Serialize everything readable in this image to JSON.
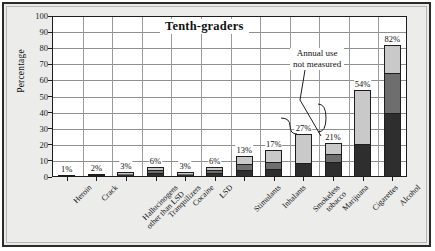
{
  "figure": {
    "title": "Tenth-graders",
    "ylabel": "Percentage",
    "annotation_line1": "Annual use",
    "annotation_line2": "not measured"
  },
  "chart_data": {
    "type": "bar",
    "subtype": "stacked-bar",
    "title": "Tenth-graders",
    "xlabel": "",
    "ylabel": "Percentage",
    "ylim": [
      0,
      100
    ],
    "yticks": [
      0,
      10,
      20,
      30,
      40,
      50,
      60,
      70,
      80,
      90,
      100
    ],
    "ytick_labels": [
      "0",
      "10",
      "20",
      "30",
      "40",
      "50",
      "60",
      "70",
      "80",
      "90",
      "100"
    ],
    "grid": true,
    "legend": null,
    "annotations": [
      {
        "text": "Annual use not measured",
        "points_to": [
          "Smokeless tobacco",
          "Cigarettes"
        ]
      }
    ],
    "categories": [
      "Heroin",
      "Crack",
      "Hallucinogens other than LSD",
      "Tranquilizers",
      "Cocaine",
      "LSD",
      "Stimulants",
      "Inhalants",
      "Smokeless tobacco",
      "Marijuana",
      "Cigarettes",
      "Alcohol"
    ],
    "data_labels": [
      "1%",
      "2%",
      "3%",
      "6%",
      "3%",
      "6%",
      "13%",
      "17%",
      "27%",
      "21%",
      "54%",
      "82%"
    ],
    "values": [
      1,
      2,
      3,
      6,
      3,
      6,
      13,
      17,
      27,
      21,
      54,
      82
    ],
    "series": [
      {
        "name": "Lifetime use",
        "color": "#c9c9c9",
        "values": [
          1,
          2,
          3,
          6,
          3,
          6,
          13,
          17,
          27,
          21,
          54,
          82
        ]
      },
      {
        "name": "Annual use",
        "color": "#6e6e6e",
        "values": [
          0.6,
          1.3,
          2,
          4,
          2,
          4,
          8,
          9,
          0,
          14,
          0,
          65
        ]
      },
      {
        "name": "Past-month use",
        "color": "#2e2e2e",
        "values": [
          0.3,
          0.7,
          1,
          2,
          1,
          2,
          4,
          4,
          8,
          9,
          20,
          40
        ]
      }
    ]
  },
  "bars": [
    {
      "label": "Heroin",
      "label_text": "1%",
      "total": 1,
      "dark": 0.3,
      "mid": 0.3,
      "light": 0.4
    },
    {
      "label": "Crack",
      "label_text": "2%",
      "total": 2,
      "dark": 0.7,
      "mid": 0.6,
      "light": 0.7
    },
    {
      "label": "Hallucinogens other than LSD",
      "label_text": "3%",
      "total": 3,
      "dark": 1.0,
      "mid": 1.0,
      "light": 1.0
    },
    {
      "label": "Tranquilizers",
      "label_text": "6%",
      "total": 6,
      "dark": 2.0,
      "mid": 2.0,
      "light": 2.0
    },
    {
      "label": "Cocaine",
      "label_text": "3%",
      "total": 3,
      "dark": 1.0,
      "mid": 1.0,
      "light": 1.0
    },
    {
      "label": "LSD",
      "label_text": "6%",
      "total": 6,
      "dark": 2.0,
      "mid": 2.0,
      "light": 2.0
    },
    {
      "label": "Stimulants",
      "label_text": "13%",
      "total": 13,
      "dark": 4.0,
      "mid": 4.0,
      "light": 5.0
    },
    {
      "label": "Inhalants",
      "label_text": "17%",
      "total": 17,
      "dark": 4.5,
      "mid": 4.5,
      "light": 8.0
    },
    {
      "label": "Smokeless tobacco",
      "label_text": "27%",
      "total": 27,
      "dark": 8.0,
      "mid": 0,
      "light": 19.0
    },
    {
      "label": "Marijuana",
      "label_text": "21%",
      "total": 21,
      "dark": 9.0,
      "mid": 5.0,
      "light": 7.0
    },
    {
      "label": "Cigarettes",
      "label_text": "54%",
      "total": 54,
      "dark": 20.0,
      "mid": 0,
      "light": 34.0
    },
    {
      "label": "Alcohol",
      "label_text": "82%",
      "total": 82,
      "dark": 40.0,
      "mid": 25.0,
      "light": 17.0
    }
  ]
}
